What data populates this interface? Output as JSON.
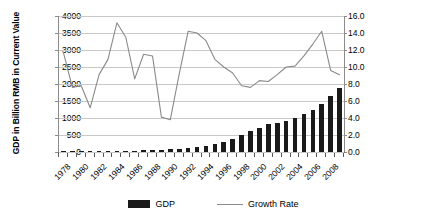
{
  "chart_data": {
    "type": "bar",
    "title": "",
    "subtitle": "",
    "xlabel": "",
    "ylabel": "GDP in Billion RMB in Current Value",
    "y2label": "Growth Rate in %",
    "grid": true,
    "legend_position": "bottom",
    "ylim": [
      0,
      4000
    ],
    "y2lim": [
      0,
      16.0
    ],
    "yticks": [
      "0",
      "500",
      "1000",
      "1500",
      "2000",
      "2500",
      "3000",
      "3500",
      "4000"
    ],
    "ytick_values": [
      0,
      500,
      1000,
      1500,
      2000,
      2500,
      3000,
      3500,
      4000
    ],
    "y2ticks": [
      "0.0",
      "2.0",
      "4.0",
      "6.0",
      "8.0",
      "10.0",
      "12.0",
      "14.0",
      "16.0"
    ],
    "y2tick_values": [
      0,
      2,
      4,
      6,
      8,
      10,
      12,
      14,
      16
    ],
    "categories": [
      "1978",
      "1979",
      "1980",
      "1981",
      "1982",
      "1983",
      "1984",
      "1985",
      "1986",
      "1987",
      "1988",
      "1989",
      "1990",
      "1991",
      "1992",
      "1993",
      "1994",
      "1995",
      "1996",
      "1997",
      "1998",
      "1999",
      "2000",
      "2001",
      "2002",
      "2003",
      "2004",
      "2005",
      "2006",
      "2007",
      "2008",
      "2009"
    ],
    "xtick_labels_shown": [
      "1978",
      "1980",
      "1982",
      "1984",
      "1986",
      "1988",
      "1990",
      "1992",
      "1994",
      "1996",
      "1998",
      "2000",
      "2002",
      "2004",
      "2006",
      "2008"
    ],
    "series": [
      {
        "name": "GDP",
        "type": "bar",
        "axis": "left",
        "unit": "Billion RMB",
        "color": "#1a1a1a",
        "values": [
          16,
          18,
          20,
          22,
          24,
          27,
          32,
          38,
          42,
          48,
          60,
          68,
          75,
          88,
          110,
          140,
          185,
          230,
          280,
          370,
          500,
          620,
          720,
          810,
          865,
          925,
          1000,
          1120,
          1230,
          1400,
          1640,
          1880
        ]
      },
      {
        "name": "Growth Rate",
        "type": "line",
        "axis": "right",
        "unit": "%",
        "color": "#8a8a8a",
        "values": [
          11.7,
          7.6,
          7.8,
          5.2,
          9.1,
          10.9,
          15.2,
          13.5,
          8.6,
          11.5,
          11.3,
          4.1,
          3.8,
          9.2,
          14.2,
          14.0,
          13.1,
          10.9,
          10.0,
          9.3,
          7.8,
          7.6,
          8.4,
          8.3,
          9.1,
          10.0,
          10.1,
          11.3,
          12.7,
          14.2,
          9.6,
          9.1
        ]
      }
    ],
    "legend": [
      {
        "label": "GDP",
        "marker": "bar-swatch",
        "color": "#1a1a1a"
      },
      {
        "label": "Growth Rate",
        "marker": "line-swatch",
        "color": "#8a8a8a"
      }
    ]
  }
}
